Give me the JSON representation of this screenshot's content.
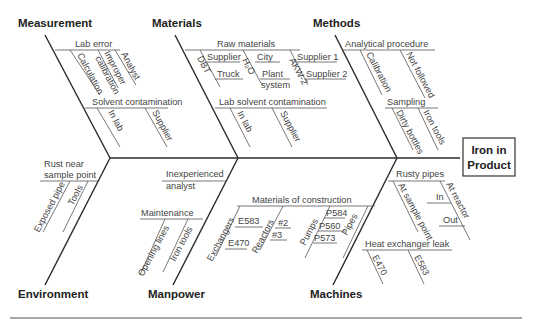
{
  "effect": {
    "line1": "Iron in",
    "line2": "Product"
  },
  "categories": {
    "measurement": "Measurement",
    "materials": "Materials",
    "methods": "Methods",
    "environment": "Environment",
    "manpower": "Manpower",
    "machines": "Machines"
  },
  "measurement": {
    "lab_error": "Lab error",
    "calculation": "Calculation",
    "improper_1": "Improper",
    "improper_2": "calibration",
    "analyst": "Analyst",
    "solvent": "Solvent contamination",
    "in_lab": "In lab",
    "supplier": "Supplier"
  },
  "materials": {
    "raw": "Raw materials",
    "dbt": "DBT",
    "supplier": "Supplier",
    "truck": "Truck",
    "h2o": "H₂O",
    "city": "City",
    "plant": "Plant",
    "system": "system",
    "akw2": "AKW-2",
    "supplier1": "Supplier 1",
    "supplier2": "Supplier 2",
    "lab_solvent": "Lab solvent contamination",
    "in_lab": "In lab",
    "supplier_b": "Supplier"
  },
  "methods": {
    "analytical": "Analytical procedure",
    "calibration": "Calibration",
    "not_followed": "Not followed",
    "sampling": "Sampling",
    "dirty_bottles": "Dirty bottles",
    "iron_tools": "Iron tools"
  },
  "environment": {
    "rust_1": "Rust near",
    "rust_2": "sample point",
    "exposed_pipe": "Exposed pipe",
    "tools": "Tools"
  },
  "manpower": {
    "inexp_1": "Inexperienced",
    "inexp_2": "analyst",
    "maintenance": "Maintenance",
    "opening_lines": "Opening lines",
    "iron_tools": "Iron tools"
  },
  "machines": {
    "moc": "Materials of construction",
    "exchangers": "Exchangers",
    "e583": "E583",
    "e470": "E470",
    "reactors": "Reactors",
    "r2": "#2",
    "r3": "#3",
    "pumps": "Pumps",
    "p584": "P584",
    "p560": "P560",
    "p573": "P573",
    "pipes": "Pipes",
    "rusty_pipes": "Rusty pipes",
    "at_sample_point": "At sample point",
    "at_reactor": "At reactor",
    "in": "In",
    "out": "Out",
    "hx_leak": "Heat exchanger leak",
    "hx_e470": "E470",
    "hx_e583": "E583"
  }
}
